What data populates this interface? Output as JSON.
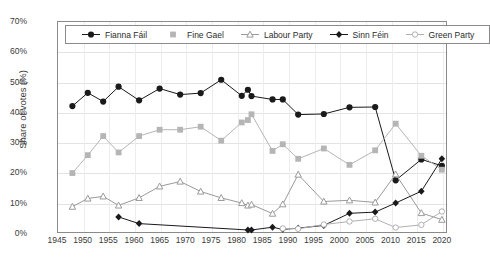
{
  "chart_data": {
    "type": "line",
    "title": "",
    "xlabel": "",
    "ylabel": "Share of votes (%)",
    "ylim": [
      0,
      70
    ],
    "xlim": [
      1945,
      2021
    ],
    "grid": true,
    "legend_position": "top-inside",
    "y_ticks": [
      "0%",
      "10%",
      "20%",
      "30%",
      "40%",
      "50%",
      "60%",
      "70%"
    ],
    "y_tick_values": [
      0,
      10,
      20,
      30,
      40,
      50,
      60,
      70
    ],
    "x_ticks": [
      "1945",
      "1950",
      "1955",
      "1960",
      "1965",
      "1970",
      "1975",
      "1980",
      "1985",
      "1990",
      "1995",
      "2000",
      "2005",
      "2010",
      "2015",
      "2020"
    ],
    "x_tick_values": [
      1945,
      1950,
      1955,
      1960,
      1965,
      1970,
      1975,
      1980,
      1985,
      1990,
      1995,
      2000,
      2005,
      2010,
      2015,
      2020
    ],
    "series": [
      {
        "name": "Fianna Fáil",
        "color": "#1a1a1a",
        "marker": "circle-filled",
        "x": [
          1948,
          1951,
          1954,
          1957,
          1961,
          1965,
          1969,
          1973,
          1977,
          1981,
          1982.2,
          1982.9,
          1987,
          1989,
          1992,
          1997,
          2002,
          2007,
          2011,
          2016,
          2020
        ],
        "values": [
          41.9,
          46.3,
          43.4,
          48.3,
          43.8,
          47.7,
          45.7,
          46.2,
          50.6,
          45.3,
          47.3,
          45.2,
          44.1,
          44.1,
          39.1,
          39.3,
          41.5,
          41.6,
          17.4,
          24.3,
          22.2
        ]
      },
      {
        "name": "Fine Gael",
        "color": "#b5b5b5",
        "marker": "square-filled",
        "x": [
          1948,
          1951,
          1954,
          1957,
          1961,
          1965,
          1969,
          1973,
          1977,
          1981,
          1982.2,
          1982.9,
          1987,
          1989,
          1992,
          1997,
          2002,
          2007,
          2011,
          2016,
          2020
        ],
        "values": [
          19.8,
          25.7,
          32.0,
          26.6,
          32.0,
          34.1,
          34.1,
          35.1,
          30.5,
          36.5,
          37.3,
          39.2,
          27.1,
          29.3,
          24.5,
          27.9,
          22.5,
          27.3,
          36.1,
          25.5,
          20.9
        ]
      },
      {
        "name": "Labour Party",
        "color": "#9a9a9a",
        "marker": "triangle-open",
        "x": [
          1948,
          1951,
          1954,
          1957,
          1961,
          1965,
          1969,
          1973,
          1977,
          1981,
          1982.2,
          1982.9,
          1987,
          1989,
          1992,
          1997,
          2002,
          2007,
          2011,
          2016,
          2020
        ],
        "values": [
          8.7,
          11.4,
          12.1,
          9.1,
          11.6,
          15.4,
          17.0,
          13.7,
          11.6,
          9.9,
          9.1,
          9.4,
          6.4,
          9.5,
          19.3,
          10.4,
          10.8,
          10.1,
          19.4,
          6.6,
          4.4
        ]
      },
      {
        "name": "Sinn Féin",
        "color": "#1a1a1a",
        "marker": "diamond-filled",
        "x": [
          1957,
          1961,
          1982.2,
          1982.9,
          1987,
          1989,
          1992,
          1997,
          2002,
          2007,
          2011,
          2016,
          2020
        ],
        "values": [
          5.3,
          3.1,
          1.0,
          1.0,
          1.9,
          1.2,
          1.6,
          2.5,
          6.5,
          6.9,
          9.9,
          13.8,
          24.5
        ]
      },
      {
        "name": "Green Party",
        "color": "#b0b0b0",
        "marker": "circle-open",
        "x": [
          1989,
          1992,
          1997,
          2002,
          2007,
          2011,
          2016,
          2020
        ],
        "values": [
          1.5,
          1.4,
          2.8,
          3.8,
          4.7,
          1.8,
          2.7,
          7.1
        ]
      }
    ]
  },
  "legend": {
    "items": [
      {
        "label": "Fianna Fáil",
        "marker": "circle-filled",
        "color": "#1a1a1a"
      },
      {
        "label": "Fine Gael",
        "marker": "square-filled",
        "color": "#b5b5b5"
      },
      {
        "label": "Labour Party",
        "marker": "triangle-open",
        "color": "#9a9a9a"
      },
      {
        "label": "Sinn Féin",
        "marker": "diamond-filled",
        "color": "#1a1a1a"
      },
      {
        "label": "Green Party",
        "marker": "circle-open",
        "color": "#b0b0b0"
      }
    ]
  }
}
